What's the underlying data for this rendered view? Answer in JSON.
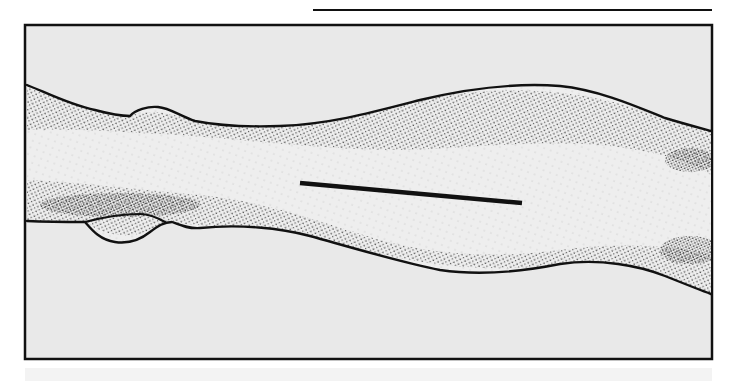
{
  "figure": {
    "width": 738,
    "height": 381,
    "colors": {
      "page": "#ffffff",
      "panel": "#e9e9e9",
      "skin": "#eeeeee",
      "ink": "#111111",
      "stipple": "#2a2a2a",
      "bottom_band": "#f3f3f3"
    },
    "top_rule": {
      "x1": 313,
      "y1": 10,
      "x2": 712,
      "y2": 10,
      "stroke_width": 2
    },
    "frame": {
      "x": 25,
      "y": 25,
      "width": 687,
      "height": 334,
      "stroke_width": 2.5
    },
    "bottom_band": {
      "x": 25,
      "y": 368,
      "width": 687,
      "height": 13
    },
    "limb": {
      "outline_top": "M27,85 C45,92 70,105 95,110 C110,114 122,116 130,116 C135,110 148,106 158,107 C170,108 180,116 195,121 C220,126 250,127 280,126 C330,124 370,113 420,100 C470,88 520,83 560,86 C600,90 640,108 665,118 C685,124 700,128 711,131",
      "outline_bottom": "M27,221 C50,222 70,222 85,222 C92,230 100,240 115,242 C128,244 140,240 150,232 C158,226 164,222 172,222 C180,225 188,229 200,228 C240,224 280,228 310,236 C360,250 400,262 440,270 C480,276 520,272 560,264 C600,258 640,266 665,276 C685,284 700,290 711,294",
      "fill_path": "M27,85 C45,92 70,105 95,110 C110,114 122,116 130,116 C135,110 148,106 158,107 C170,108 180,116 195,121 C220,126 250,127 280,126 C330,124 370,113 420,100 C470,88 520,83 560,86 C600,90 640,108 665,118 C685,124 700,128 711,131 L711,294 C700,290 685,284 665,276 C640,266 600,258 560,264 C520,272 480,276 440,270 C400,262 360,250 310,236 C280,228 240,224 200,228 C188,229 180,225 172,222 C164,222 158,226 150,232 C140,240 128,244 115,242 C100,240 92,230 85,222 C70,222 50,222 27,221 Z",
      "lower_bulge": "M85,222 C100,218 120,214 140,214 C150,214 158,218 165,222",
      "stipple_bands": [
        "M27,85 C70,105 110,114 130,116 C150,108 175,114 195,121 C250,128 330,124 420,100 C500,84 580,86 665,118 L711,131 L711,175 C690,160 650,150 600,145 C520,140 450,150 400,150 C330,150 250,140 180,135 C120,132 70,128 27,130 Z",
        "M27,180 C80,182 140,190 200,195 C260,200 320,222 380,240 C440,256 500,258 560,250 C620,242 680,245 711,255 L711,294 C680,282 620,256 560,264 C480,276 400,262 310,236 C250,224 200,228 172,222 C150,232 120,246 85,222 L27,221 Z"
      ],
      "dense_patches": [
        {
          "cx": 690,
          "cy": 160,
          "rx": 25,
          "ry": 12
        },
        {
          "cx": 690,
          "cy": 250,
          "rx": 30,
          "ry": 14
        },
        {
          "cx": 120,
          "cy": 205,
          "rx": 80,
          "ry": 12
        }
      ]
    },
    "incision_line": {
      "x1": 300,
      "y1": 183,
      "x2": 522,
      "y2": 203,
      "stroke_width": 4.5
    }
  }
}
